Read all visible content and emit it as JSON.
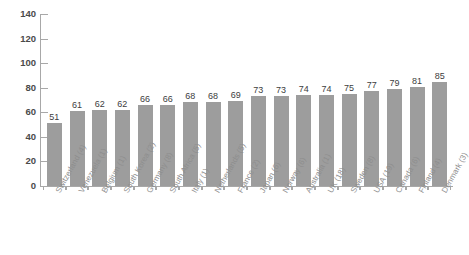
{
  "chart_data": {
    "type": "bar",
    "title": "",
    "subtitle": "",
    "xlabel": "",
    "ylabel": "",
    "ylim": [
      0,
      140
    ],
    "ytick_labels": [
      "140",
      "120",
      "100",
      "80",
      "60",
      "40",
      "20",
      "0"
    ],
    "ytick_values": [
      140,
      120,
      100,
      80,
      60,
      40,
      20,
      0
    ],
    "grid": false,
    "legend": false,
    "legend_position": "none",
    "bar_color": "#9d9d9d",
    "axis_color": "#a8a8a8",
    "value_label_color": "#3d3d3d",
    "category_label_color": "#8e8e8e",
    "categories": [
      "Switzerland (4)",
      "Venezuela (1)",
      "Belgium (1)",
      "South Korea (2)",
      "Germany (8)",
      "South Africa (5)",
      "Italy (1)",
      "Netherlands (5)",
      "France (2)",
      "Japan (6)",
      "Norway (6)",
      "Australia (1)",
      "UK (18)",
      "Sweden (8)",
      "USA (19)",
      "Canada (6)",
      "Finland (4)",
      "Denmark (3)"
    ],
    "values": [
      51,
      61,
      62,
      62,
      66,
      66,
      68,
      68,
      69,
      73,
      73,
      74,
      74,
      75,
      77,
      79,
      81,
      85
    ]
  }
}
